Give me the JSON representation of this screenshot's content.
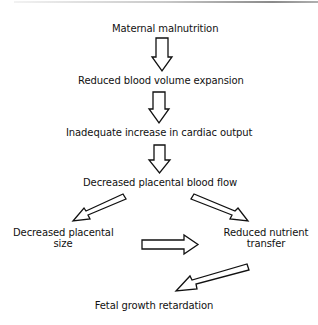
{
  "diagram": {
    "type": "flowchart",
    "nodes": {
      "n1": {
        "label": "Maternal malnutrition"
      },
      "n2": {
        "label": "Reduced blood volume expansion"
      },
      "n3": {
        "label": "Inadequate increase in cardiac output"
      },
      "n4": {
        "label": "Decreased placental blood flow"
      },
      "n5": {
        "line1": "Decreased placental",
        "line2": "size"
      },
      "n6": {
        "line1": "Reduced nutrient",
        "line2": "transfer"
      },
      "n7": {
        "label": "Fetal growth retardation"
      }
    },
    "edges": [
      {
        "from": "Maternal malnutrition",
        "to": "Reduced blood volume expansion",
        "style": "hollow-block-arrow"
      },
      {
        "from": "Reduced blood volume expansion",
        "to": "Inadequate increase in cardiac output",
        "style": "hollow-block-arrow"
      },
      {
        "from": "Inadequate increase in cardiac output",
        "to": "Decreased placental blood flow",
        "style": "hollow-block-arrow"
      },
      {
        "from": "Decreased placental blood flow",
        "to": "Decreased placental size",
        "style": "hollow-block-arrow"
      },
      {
        "from": "Decreased placental blood flow",
        "to": "Reduced nutrient transfer",
        "style": "hollow-block-arrow"
      },
      {
        "from": "Decreased placental size",
        "to": "Reduced nutrient transfer",
        "style": "hollow-block-arrow"
      },
      {
        "from": "Reduced nutrient transfer",
        "to": "Fetal growth retardation",
        "style": "hollow-block-arrow"
      }
    ],
    "colors": {
      "stroke": "#111111",
      "fill": "#ffffff",
      "background": "#ffffff"
    }
  }
}
